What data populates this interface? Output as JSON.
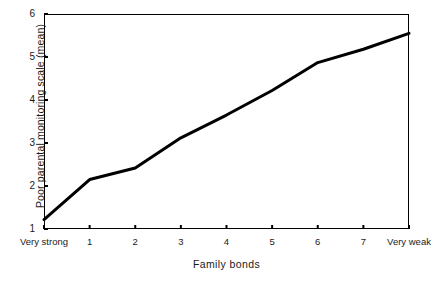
{
  "chart_data": {
    "type": "line",
    "title": "",
    "xlabel": "Family bonds",
    "ylabel": "Poor parental monitoring scale  (mean)",
    "categories": [
      "Very strong",
      "1",
      "2",
      "3",
      "4",
      "5",
      "6",
      "7",
      "Very weak"
    ],
    "values": [
      1.22,
      2.15,
      2.42,
      3.12,
      3.65,
      4.22,
      4.87,
      5.18,
      5.55
    ],
    "series": [
      {
        "name": "Poor parental monitoring scale (mean)",
        "values": [
          1.22,
          2.15,
          2.42,
          3.12,
          3.65,
          4.22,
          4.87,
          5.18,
          5.55
        ]
      }
    ],
    "ylim": [
      1,
      6
    ],
    "yticks": [
      1,
      2,
      3,
      4,
      5,
      6
    ],
    "ytick_labels": [
      "1",
      "2",
      "3",
      "4",
      "5",
      "6"
    ],
    "xtick_labels": [
      "Very strong",
      "1",
      "2",
      "3",
      "4",
      "5",
      "6",
      "7",
      "Very weak"
    ],
    "grid": false,
    "legend": false,
    "legend_position": "none",
    "line_color": "#000000",
    "line_width": 3,
    "axis_color": "#000000",
    "background_color": "#ffffff"
  }
}
